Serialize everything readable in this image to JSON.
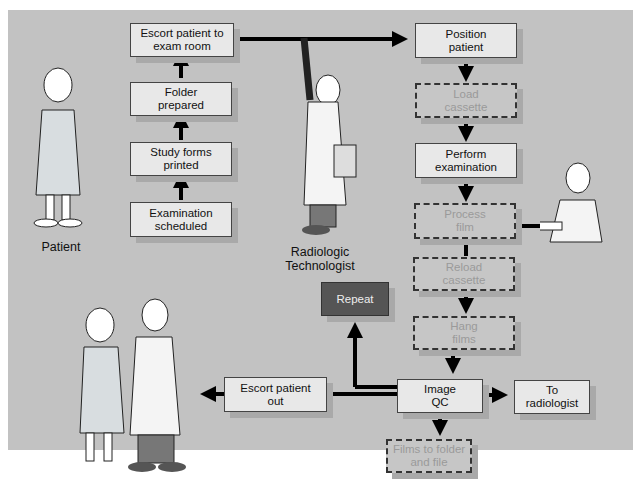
{
  "figure": {
    "actors": {
      "patient": "Patient",
      "technologist": "Radiologic\nTechnologist"
    },
    "nodes": [
      {
        "id": "escort-to-exam",
        "label": "Escort patient to\nexam room",
        "style": "solid"
      },
      {
        "id": "folder-prepared",
        "label": "Folder\nprepared",
        "style": "solid"
      },
      {
        "id": "study-forms",
        "label": "Study forms\nprinted",
        "style": "solid"
      },
      {
        "id": "exam-scheduled",
        "label": "Examination\nscheduled",
        "style": "solid"
      },
      {
        "id": "position-patient",
        "label": "Position\npatient",
        "style": "solid"
      },
      {
        "id": "load-cassette",
        "label": "Load\ncassette",
        "style": "dashed"
      },
      {
        "id": "perform-exam",
        "label": "Perform\nexamination",
        "style": "solid"
      },
      {
        "id": "process-film",
        "label": "Process\nfilm",
        "style": "dashed"
      },
      {
        "id": "reload-cassette",
        "label": "Reload\ncassette",
        "style": "dashed"
      },
      {
        "id": "hang-films",
        "label": "Hang\nfilms",
        "style": "dashed"
      },
      {
        "id": "repeat",
        "label": "Repeat",
        "style": "dark"
      },
      {
        "id": "image-qc",
        "label": "Image\nQC",
        "style": "solid"
      },
      {
        "id": "to-radiologist",
        "label": "To\nradiologist",
        "style": "solid"
      },
      {
        "id": "escort-out",
        "label": "Escort patient\nout",
        "style": "solid"
      },
      {
        "id": "films-to-folder",
        "label": "Films to folder\nand file",
        "style": "dashed"
      }
    ],
    "colors": {
      "panel": "#c2c2c2",
      "box": "#e8e8e8",
      "dashed_text": "#9a9a9a",
      "repeat_box": "#555555"
    }
  }
}
